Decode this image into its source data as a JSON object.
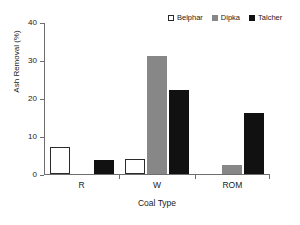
{
  "chart_data": {
    "type": "bar",
    "title": "",
    "xlabel": "Coal Type",
    "ylabel": "Ash Removal (%)",
    "categories": [
      "R",
      "W",
      "ROM"
    ],
    "series": [
      {
        "name": "Belphar",
        "values": [
          7,
          4,
          0
        ],
        "color": "#ffffff",
        "edgecolor": "#2b2b2b"
      },
      {
        "name": "Dipka",
        "values": [
          0,
          31,
          2.5
        ],
        "color": "#878787",
        "edgecolor": "#878787"
      },
      {
        "name": "Talcher",
        "values": [
          3.6,
          22,
          16
        ],
        "color": "#111111",
        "edgecolor": "#111111"
      }
    ],
    "ylim": [
      0,
      40
    ],
    "yticks": [
      0,
      10,
      20,
      30,
      40
    ],
    "ytick_labels": [
      "0",
      "10",
      "20",
      "30",
      "40"
    ],
    "grid": false,
    "legend_position": "top-right"
  },
  "legend": {
    "entries": [
      {
        "label": "Belphar"
      },
      {
        "label": "Dipka"
      },
      {
        "label": "Talcher"
      }
    ]
  },
  "axes": {
    "x_title": "Coal Type",
    "y_title": "Ash Removal (%)"
  }
}
